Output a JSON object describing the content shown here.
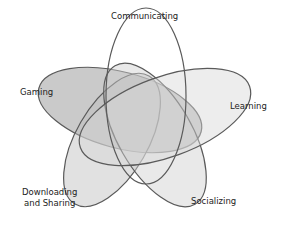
{
  "diagram": {
    "type": "venn",
    "sets": [
      {
        "id": "gaming",
        "label": "Gaming",
        "fill": "#8a8a8a",
        "fill_opacity": 0.45
      },
      {
        "id": "downloading",
        "label": "Downloading and Sharing",
        "label_lines": [
          "Downloading",
          "and Sharing"
        ],
        "fill": "#bdbdbd",
        "fill_opacity": 0.45
      },
      {
        "id": "socializing",
        "label": "Socializing",
        "fill": "#cfcfcf",
        "fill_opacity": 0.45
      },
      {
        "id": "learning",
        "label": "Learning",
        "fill": "#d8d8d8",
        "fill_opacity": 0.45
      },
      {
        "id": "communicating",
        "label": "Communicating",
        "fill": "#ffffff",
        "fill_opacity": 0.0
      }
    ],
    "stroke_color": "#5a5a5a"
  }
}
